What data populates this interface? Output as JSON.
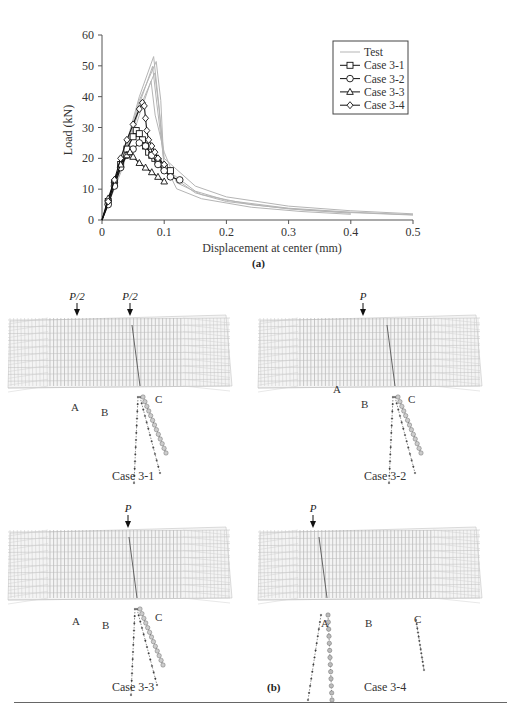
{
  "figure": {
    "panel_a_label": "(a)",
    "panel_b_label": "(b)"
  },
  "chart_data": {
    "type": "line",
    "title": "",
    "xlabel": "Displacement at center (mm)",
    "ylabel": "Load (kN)",
    "xlim": [
      0,
      0.5
    ],
    "ylim": [
      0,
      60
    ],
    "x_ticks": [
      "0",
      "0.1",
      "0.2",
      "0.3",
      "0.4",
      "0.5"
    ],
    "y_ticks": [
      "0",
      "10",
      "20",
      "30",
      "40",
      "50",
      "60"
    ],
    "grid": false,
    "legend_position": "upper right",
    "legend": [
      "Test",
      "Case 3-1",
      "Case 3-2",
      "Case 3-3",
      "Case 3-4"
    ],
    "series": [
      {
        "name": "Test",
        "marker": "none",
        "color": "#b5b5b5",
        "x": [
          0,
          0.03,
          0.06,
          0.083,
          0.09,
          0.1,
          0.15,
          0.2,
          0.3,
          0.4,
          0.5
        ],
        "y": [
          0,
          18,
          40,
          53,
          40,
          20,
          11,
          7.5,
          4.5,
          3,
          2
        ]
      },
      {
        "name": "Case 3-1",
        "marker": "square",
        "color": "#111111",
        "x": [
          0,
          0.01,
          0.02,
          0.03,
          0.04,
          0.05,
          0.055,
          0.06,
          0.065,
          0.07,
          0.075,
          0.08,
          0.085,
          0.09,
          0.1,
          0.11
        ],
        "y": [
          0,
          6,
          12,
          18,
          23,
          27,
          29,
          28,
          26,
          24,
          22,
          21,
          20,
          19,
          17,
          16
        ]
      },
      {
        "name": "Case 3-2",
        "marker": "circle",
        "color": "#111111",
        "x": [
          0,
          0.01,
          0.02,
          0.03,
          0.04,
          0.05,
          0.06,
          0.07,
          0.08,
          0.09,
          0.1,
          0.11,
          0.125
        ],
        "y": [
          0,
          5,
          11,
          17,
          21,
          23,
          25,
          24,
          21,
          18,
          16,
          14,
          13
        ]
      },
      {
        "name": "Case 3-3",
        "marker": "triangle",
        "color": "#111111",
        "x": [
          0,
          0.01,
          0.02,
          0.03,
          0.04,
          0.045,
          0.05,
          0.06,
          0.07,
          0.08,
          0.09,
          0.1
        ],
        "y": [
          0,
          7,
          13,
          18,
          21,
          22,
          20.5,
          18.5,
          17,
          15.5,
          14,
          12.5
        ]
      },
      {
        "name": "Case 3-4",
        "marker": "diamond",
        "color": "#111111",
        "x": [
          0,
          0.01,
          0.02,
          0.03,
          0.04,
          0.05,
          0.06,
          0.065,
          0.068,
          0.07,
          0.072,
          0.075,
          0.08,
          0.085,
          0.09,
          0.1
        ],
        "y": [
          0,
          6,
          13,
          20,
          26,
          31,
          36,
          38,
          37,
          33,
          29,
          26,
          24,
          22,
          20,
          18
        ]
      }
    ]
  },
  "diagrams": [
    {
      "id": "case-3-1",
      "caption": "Case 3-1",
      "loads": [
        "P/2",
        "P/2"
      ],
      "points": [
        "A",
        "B",
        "C"
      ]
    },
    {
      "id": "case-3-2",
      "caption": "Case 3-2",
      "loads": [
        "P"
      ],
      "points": [
        "A",
        "B",
        "C"
      ]
    },
    {
      "id": "case-3-3",
      "caption": "Case 3-3",
      "loads": [
        "P"
      ],
      "points": [
        "A",
        "B",
        "C"
      ]
    },
    {
      "id": "case-3-4",
      "caption": "Case 3-4",
      "loads": [
        "P"
      ],
      "points": [
        "A",
        "B",
        "C"
      ]
    }
  ]
}
